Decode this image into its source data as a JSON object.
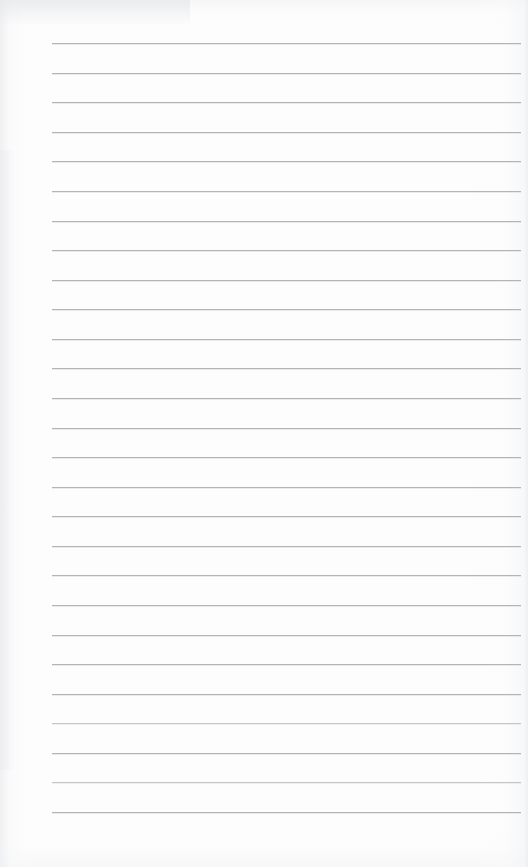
{
  "document": {
    "kind": "ruled-notepad-page",
    "title": "Blank Ruled Notepad Page",
    "page_label": "",
    "body_text": "",
    "placeholder": "",
    "header_text": "",
    "footer_text": "",
    "margin_note": ""
  },
  "paper": {
    "background_color": "#fdfdfd",
    "page_width": 528,
    "page_height": 867,
    "edge_shadow_color": "#eceef0"
  },
  "ruling": {
    "line_color": "#a9abae",
    "line_thickness_px": 1,
    "line_spacing_px": 29.58,
    "first_line_y": 43,
    "left_x": 52,
    "right_x": 521,
    "line_count": 27,
    "lines": [
      {
        "index": 1,
        "y": 43.0,
        "x1": 52,
        "x2": 521,
        "soft": false
      },
      {
        "index": 2,
        "y": 72.6,
        "x1": 52,
        "x2": 521,
        "soft": false
      },
      {
        "index": 3,
        "y": 102.2,
        "x1": 52,
        "x2": 521,
        "soft": false
      },
      {
        "index": 4,
        "y": 131.7,
        "x1": 52,
        "x2": 521,
        "soft": false
      },
      {
        "index": 5,
        "y": 161.3,
        "x1": 52,
        "x2": 521,
        "soft": false
      },
      {
        "index": 6,
        "y": 190.9,
        "x1": 52,
        "x2": 521,
        "soft": false
      },
      {
        "index": 7,
        "y": 220.5,
        "x1": 52,
        "x2": 521,
        "soft": false
      },
      {
        "index": 8,
        "y": 250.0,
        "x1": 52,
        "x2": 521,
        "soft": false
      },
      {
        "index": 9,
        "y": 279.6,
        "x1": 52,
        "x2": 521,
        "soft": false
      },
      {
        "index": 10,
        "y": 309.2,
        "x1": 52,
        "x2": 521,
        "soft": false
      },
      {
        "index": 11,
        "y": 338.8,
        "x1": 52,
        "x2": 521,
        "soft": false
      },
      {
        "index": 12,
        "y": 368.3,
        "x1": 52,
        "x2": 521,
        "soft": false
      },
      {
        "index": 13,
        "y": 397.9,
        "x1": 52,
        "x2": 521,
        "soft": false
      },
      {
        "index": 14,
        "y": 427.5,
        "x1": 52,
        "x2": 521,
        "soft": false
      },
      {
        "index": 15,
        "y": 457.1,
        "x1": 52,
        "x2": 521,
        "soft": false
      },
      {
        "index": 16,
        "y": 486.6,
        "x1": 52,
        "x2": 521,
        "soft": false
      },
      {
        "index": 17,
        "y": 516.2,
        "x1": 52,
        "x2": 521,
        "soft": false
      },
      {
        "index": 18,
        "y": 545.8,
        "x1": 52,
        "x2": 521,
        "soft": false
      },
      {
        "index": 19,
        "y": 575.4,
        "x1": 52,
        "x2": 521,
        "soft": false
      },
      {
        "index": 20,
        "y": 604.9,
        "x1": 52,
        "x2": 521,
        "soft": false
      },
      {
        "index": 21,
        "y": 634.5,
        "x1": 52,
        "x2": 521,
        "soft": false
      },
      {
        "index": 22,
        "y": 664.1,
        "x1": 52,
        "x2": 521,
        "soft": false
      },
      {
        "index": 23,
        "y": 693.7,
        "x1": 52,
        "x2": 521,
        "soft": false
      },
      {
        "index": 24,
        "y": 723.2,
        "x1": 52,
        "x2": 521,
        "soft": true
      },
      {
        "index": 25,
        "y": 752.8,
        "x1": 52,
        "x2": 521,
        "soft": false
      },
      {
        "index": 26,
        "y": 782.4,
        "x1": 52,
        "x2": 521,
        "soft": true
      },
      {
        "index": 27,
        "y": 812.0,
        "x1": 52,
        "x2": 521,
        "soft": false
      }
    ]
  }
}
